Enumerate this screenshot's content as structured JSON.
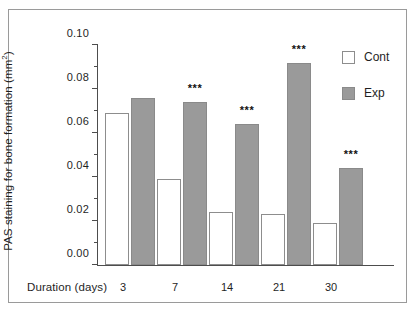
{
  "chart_data": {
    "type": "bar",
    "title": "",
    "xlabel": "Duration (days)",
    "ylabel": "PAS staining for bone formation (mm²)",
    "ylabel_main": "PAS staining for bone formation (mm",
    "ylabel_sup": "2",
    "ylabel_tail": ")",
    "categories": [
      "3",
      "7",
      "14",
      "21",
      "30"
    ],
    "series": [
      {
        "name": "Cont",
        "values": [
          0.069,
          0.039,
          0.024,
          0.023,
          0.019
        ],
        "color": "#ffffff"
      },
      {
        "name": "Exp",
        "values": [
          0.076,
          0.074,
          0.064,
          0.092,
          0.044
        ],
        "color": "#9a9a9a"
      }
    ],
    "annotations": [
      "",
      "***",
      "***",
      "***",
      "***"
    ],
    "ylim": [
      0.0,
      0.1
    ],
    "ytick_values": [
      0.0,
      0.02,
      0.04,
      0.06,
      0.08,
      0.1
    ],
    "ytick_labels": [
      "0.00",
      "0.02",
      "0.04",
      "0.06",
      "0.08",
      "0.10"
    ],
    "yminor_values": [
      0.01,
      0.03,
      0.05,
      0.07,
      0.09
    ],
    "grid": false,
    "legend_position": "right-top",
    "significance_marker": "***"
  },
  "legend": {
    "entries": [
      {
        "label": "Cont",
        "swatch": "cont"
      },
      {
        "label": "Exp",
        "swatch": "exp"
      }
    ]
  },
  "colors": {
    "exp_fill": "#9a9a9a",
    "cont_fill": "#ffffff",
    "axis": "#4d4d4d",
    "frame": "#9a9a9a",
    "text": "#1f1f1f"
  }
}
